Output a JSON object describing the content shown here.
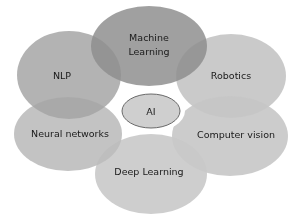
{
  "diagram": {
    "type": "flower-venn",
    "center": {
      "label": "AI",
      "fill": "#d0d0d0",
      "stroke": "#6a6a6a"
    },
    "petals": [
      {
        "id": "machine-learning",
        "label_line1": "Machine",
        "label_line2": "Learning",
        "fill": "#8f8f8f"
      },
      {
        "id": "nlp",
        "label": "NLP",
        "fill": "#a6a6a6"
      },
      {
        "id": "robotics",
        "label": "Robotics",
        "fill": "#c4c4c4"
      },
      {
        "id": "neural-networks",
        "label": "Neural networks",
        "fill": "#bdbdbd"
      },
      {
        "id": "computer-vision",
        "label": "Computer vision",
        "fill": "#c6c6c6"
      },
      {
        "id": "deep-learning",
        "label": "Deep Learning",
        "fill": "#c9c9c9"
      }
    ],
    "petal_opacity": 0.85
  }
}
